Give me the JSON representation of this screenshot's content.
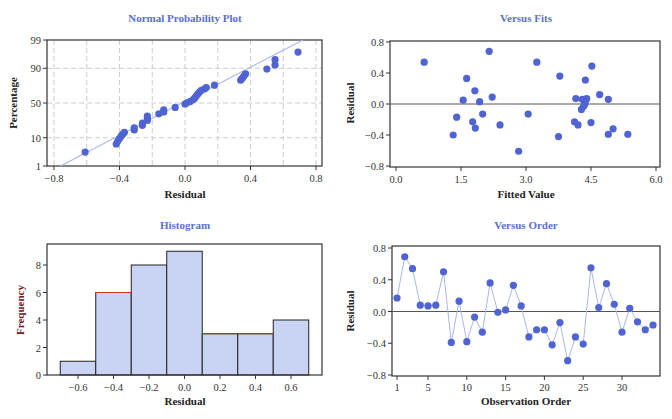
{
  "colors": {
    "title": "#5a6fd6",
    "point": "#4f63d2",
    "line": "#a9b6ee",
    "bar_fill": "#c9d4f4",
    "bar_edge": "#222222",
    "bar_highlight": "#c0392b",
    "grid": "#cccccc"
  },
  "chart_data": [
    {
      "type": "scatter",
      "title": "Normal Probability Plot",
      "xlabel": "Residual",
      "ylabel": "Percentage",
      "xlim": [
        -0.8,
        0.8
      ],
      "xticks": [
        "-0.8",
        "-0.4",
        "0.0",
        "0.4",
        "0.8"
      ],
      "yticks": [
        "1",
        "10",
        "50",
        "90",
        "99"
      ],
      "grid": true,
      "fit_line": {
        "x": [
          -0.76,
          0.72
        ],
        "pct": [
          1,
          99
        ]
      },
      "points": [
        {
          "x": -0.61,
          "pct": 3.5
        },
        {
          "x": -0.42,
          "pct": 6.5
        },
        {
          "x": -0.41,
          "pct": 8
        },
        {
          "x": -0.4,
          "pct": 9.5
        },
        {
          "x": -0.39,
          "pct": 11
        },
        {
          "x": -0.38,
          "pct": 12.5
        },
        {
          "x": -0.37,
          "pct": 14
        },
        {
          "x": -0.31,
          "pct": 16
        },
        {
          "x": -0.31,
          "pct": 18
        },
        {
          "x": -0.26,
          "pct": 20.5
        },
        {
          "x": -0.26,
          "pct": 23
        },
        {
          "x": -0.23,
          "pct": 26
        },
        {
          "x": -0.23,
          "pct": 29
        },
        {
          "x": -0.23,
          "pct": 31.5
        },
        {
          "x": -0.16,
          "pct": 34.5
        },
        {
          "x": -0.13,
          "pct": 37
        },
        {
          "x": -0.13,
          "pct": 40
        },
        {
          "x": -0.06,
          "pct": 43.5
        },
        {
          "x": 0.0,
          "pct": 48.5
        },
        {
          "x": 0.01,
          "pct": 50
        },
        {
          "x": 0.03,
          "pct": 52
        },
        {
          "x": 0.05,
          "pct": 55
        },
        {
          "x": 0.06,
          "pct": 57.5
        },
        {
          "x": 0.07,
          "pct": 60.5
        },
        {
          "x": 0.08,
          "pct": 63.5
        },
        {
          "x": 0.09,
          "pct": 66
        },
        {
          "x": 0.1,
          "pct": 68
        },
        {
          "x": 0.12,
          "pct": 70
        },
        {
          "x": 0.13,
          "pct": 71.5
        },
        {
          "x": 0.18,
          "pct": 74.5
        },
        {
          "x": 0.34,
          "pct": 80
        },
        {
          "x": 0.35,
          "pct": 82
        },
        {
          "x": 0.36,
          "pct": 84
        },
        {
          "x": 0.37,
          "pct": 86
        },
        {
          "x": 0.5,
          "pct": 89.5
        },
        {
          "x": 0.55,
          "pct": 92
        },
        {
          "x": 0.55,
          "pct": 94.5
        },
        {
          "x": 0.69,
          "pct": 97
        }
      ]
    },
    {
      "type": "scatter",
      "title": "Versus Fits",
      "xlabel": "Fitted Value",
      "ylabel": "Residual",
      "xlim": [
        0.0,
        6.0
      ],
      "ylim": [
        -0.8,
        0.8
      ],
      "xticks": [
        "0.0",
        "1.5",
        "3.0",
        "4.5",
        "6.0"
      ],
      "yticks": [
        "-0.8",
        "-0.4",
        "0.0",
        "0.4",
        "0.8"
      ],
      "reference_line": 0.0,
      "points": [
        {
          "x": 0.65,
          "y": 0.54
        },
        {
          "x": 1.32,
          "y": -0.4
        },
        {
          "x": 1.4,
          "y": -0.17
        },
        {
          "x": 1.55,
          "y": 0.05
        },
        {
          "x": 1.63,
          "y": 0.33
        },
        {
          "x": 1.77,
          "y": -0.23
        },
        {
          "x": 1.82,
          "y": 0.17
        },
        {
          "x": 1.83,
          "y": -0.31
        },
        {
          "x": 1.93,
          "y": 0.03
        },
        {
          "x": 2.0,
          "y": -0.13
        },
        {
          "x": 2.15,
          "y": 0.68
        },
        {
          "x": 2.22,
          "y": 0.09
        },
        {
          "x": 2.4,
          "y": -0.27
        },
        {
          "x": 2.83,
          "y": -0.61
        },
        {
          "x": 3.05,
          "y": -0.13
        },
        {
          "x": 3.25,
          "y": 0.54
        },
        {
          "x": 3.75,
          "y": -0.42
        },
        {
          "x": 3.78,
          "y": 0.36
        },
        {
          "x": 4.12,
          "y": -0.23
        },
        {
          "x": 4.15,
          "y": 0.07
        },
        {
          "x": 4.2,
          "y": -0.27
        },
        {
          "x": 4.28,
          "y": -0.07
        },
        {
          "x": 4.3,
          "y": 0.06
        },
        {
          "x": 4.33,
          "y": -0.03
        },
        {
          "x": 4.36,
          "y": 0.0
        },
        {
          "x": 4.37,
          "y": 0.31
        },
        {
          "x": 4.38,
          "y": 0.05
        },
        {
          "x": 4.4,
          "y": 0.07
        },
        {
          "x": 4.5,
          "y": -0.24
        },
        {
          "x": 4.52,
          "y": 0.49
        },
        {
          "x": 4.7,
          "y": 0.12
        },
        {
          "x": 4.9,
          "y": -0.39
        },
        {
          "x": 4.9,
          "y": 0.06
        },
        {
          "x": 5.01,
          "y": -0.32
        },
        {
          "x": 5.35,
          "y": -0.39
        }
      ]
    },
    {
      "type": "bar",
      "title": "Histogram",
      "xlabel": "Residual",
      "ylabel": "Frequency",
      "bin_edges": [
        -0.7,
        -0.5,
        -0.3,
        -0.1,
        0.1,
        0.3,
        0.5,
        0.7
      ],
      "categories": [
        "-0.6",
        "-0.4",
        "-0.2",
        "0.0",
        "0.2",
        "0.4",
        "0.6"
      ],
      "values": [
        1,
        6,
        8,
        9,
        3,
        3,
        4
      ],
      "xticks": [
        "-0.6",
        "-0.4",
        "-0.2",
        "0.0",
        "0.2",
        "0.4",
        "0.6"
      ],
      "yticks": [
        "0",
        "2",
        "4",
        "6",
        "8"
      ],
      "ylim": [
        0,
        9.3
      ]
    },
    {
      "type": "line",
      "title": "Versus Order",
      "xlabel": "Observation Order",
      "ylabel": "Residual",
      "ylim": [
        -0.8,
        0.8
      ],
      "xticks": [
        "1",
        "5",
        "10",
        "15",
        "20",
        "25",
        "30"
      ],
      "yticks": [
        "-0.8",
        "-0.4",
        "0.0",
        "0.4",
        "0.8"
      ],
      "reference_line": 0.0,
      "x": [
        1,
        2,
        3,
        4,
        5,
        6,
        7,
        8,
        9,
        10,
        11,
        12,
        13,
        14,
        15,
        16,
        17,
        18,
        19,
        20,
        21,
        22,
        23,
        24,
        25,
        26,
        27,
        28,
        29,
        30,
        31,
        32,
        33,
        34
      ],
      "values": [
        0.17,
        0.69,
        0.54,
        0.08,
        0.07,
        0.08,
        0.5,
        -0.39,
        0.13,
        -0.38,
        -0.07,
        -0.26,
        0.36,
        -0.01,
        0.02,
        0.33,
        0.07,
        -0.32,
        -0.23,
        -0.23,
        -0.42,
        -0.14,
        -0.62,
        -0.32,
        -0.41,
        0.55,
        0.05,
        0.35,
        0.09,
        -0.26,
        0.04,
        -0.13,
        -0.23,
        -0.17
      ]
    }
  ]
}
